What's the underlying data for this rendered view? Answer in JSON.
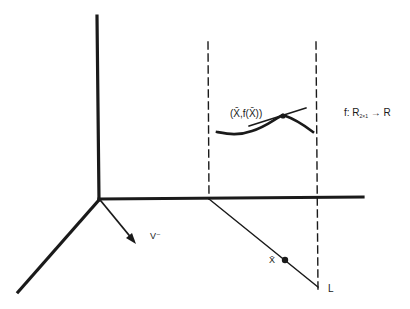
{
  "figure": {
    "labels": {
      "point": "(X̄,f(X̄))",
      "function_name": "f: R",
      "function_subscript": "2×1",
      "function_arrow_target": "→ R",
      "direction_vector": "V⁻",
      "point_on_line": "X̄",
      "line_name": "L"
    },
    "colors": {
      "ink": "#1a1a1a",
      "background": "#ffffff"
    }
  }
}
